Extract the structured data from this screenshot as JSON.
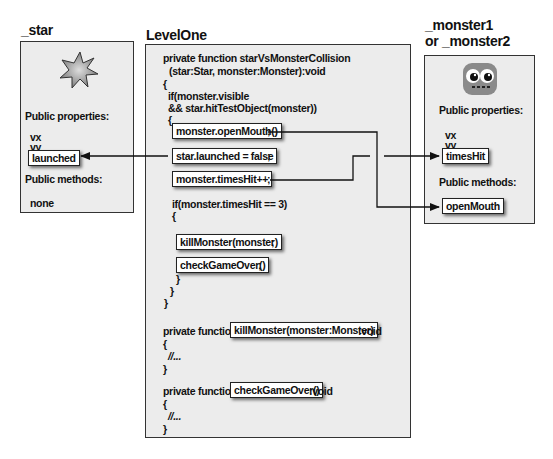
{
  "star_panel": {
    "title": "_star",
    "icon": "star-icon",
    "properties_heading": "Public properties:",
    "properties": [
      "vx",
      "vy",
      "launched"
    ],
    "methods_heading": "Public methods:",
    "methods": [
      "none"
    ]
  },
  "levelone_panel": {
    "title": "LevelOne",
    "lines": {
      "l1": "private function starVsMonsterCollision",
      "l2": "(star:Star, monster:Monster):void",
      "l3": "{",
      "l4": "if(monster.visible",
      "l5": "&& star.hitTestObject(monster))",
      "l6": "{",
      "hl_openmouth": "monster.openMouth()",
      "semi1": ";",
      "hl_launched": "star.launched = false",
      "semi2": ";",
      "hl_timeshit": "monster.timesHit++",
      "semi3": ";",
      "l10": "if(monster.timesHit == 3)",
      "l11": "{",
      "hl_kill": "killMonster(monster)",
      "semi4": ";",
      "hl_check": "checkGameOver()",
      "semi5": ";",
      "l14": "}",
      "l15": "}",
      "l16": "}",
      "f2_prefix": "private function",
      "f2_name": "killMonster(monster:Monster)",
      "f2_suffix": ":void",
      "f2_open": "{",
      "f2_body": "//...",
      "f2_close": "}",
      "f3_prefix": "private function",
      "f3_name": "checkGameOver()",
      "f3_suffix": ":void",
      "f3_open": "{",
      "f3_body": "//...",
      "f3_close": "}"
    }
  },
  "monster_panel": {
    "title_line1": "_monster1",
    "title_line2": "or _monster2",
    "icon": "monster-icon",
    "properties_heading": "Public properties:",
    "properties": [
      "vx",
      "vy",
      "timesHit"
    ],
    "methods_heading": "Public methods:",
    "methods": [
      "openMouth"
    ]
  },
  "connections": [
    {
      "from": "star.launched = false",
      "to": "_star.launched"
    },
    {
      "from": "monster.timesHit++",
      "to": "_monster.timesHit"
    },
    {
      "from": "monster.openMouth()",
      "to": "_monster.openMouth"
    }
  ]
}
